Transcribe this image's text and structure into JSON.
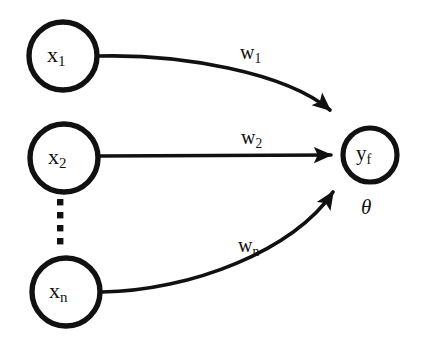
{
  "figure": {
    "background_color": "#ffffff",
    "stroke_color": "#111111",
    "width": 426,
    "height": 340
  },
  "input_nodes": [
    {
      "id": "x1",
      "label_base": "x",
      "label_sub": "1",
      "cx": 63,
      "cy": 56,
      "r": 34
    },
    {
      "id": "x2",
      "label_base": "x",
      "label_sub": "2",
      "cx": 64,
      "cy": 158,
      "r": 34
    },
    {
      "id": "xn",
      "label_base": "x",
      "label_sub": "n",
      "cx": 66,
      "cy": 292,
      "r": 34
    }
  ],
  "output_node": {
    "id": "yf",
    "label_base": "y",
    "label_sub": "f",
    "cx": 370,
    "cy": 155,
    "r": 27
  },
  "bias": {
    "symbol": "θ",
    "name": "theta"
  },
  "connections": [
    {
      "id": "w1",
      "from": "x1",
      "to": "yf",
      "label_base": "w",
      "label_sub": "1",
      "shape": "curved"
    },
    {
      "id": "w2",
      "from": "x2",
      "to": "yf",
      "label_base": "w",
      "label_sub": "2",
      "shape": "straight"
    },
    {
      "id": "wn",
      "from": "xn",
      "to": "yf",
      "label_base": "w",
      "label_sub": "n",
      "shape": "curved"
    }
  ],
  "ellipsis": {
    "name": "vertical-ellipsis",
    "dot_count": 4,
    "x": 57,
    "dot_size": 6,
    "ys": [
      199,
      212,
      225,
      238
    ]
  }
}
